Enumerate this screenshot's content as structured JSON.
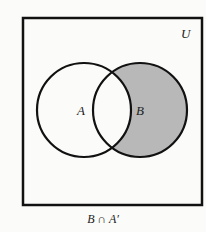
{
  "diagram": {
    "type": "venn",
    "universe_label": "U",
    "sets": [
      {
        "label": "A",
        "cx": 84,
        "cy": 110,
        "r": 47
      },
      {
        "label": "B",
        "cx": 140,
        "cy": 110,
        "r": 47
      }
    ],
    "shaded_region": "B minus A",
    "shade_color": "#b8b8b8",
    "caption": "B ∩ A′"
  }
}
